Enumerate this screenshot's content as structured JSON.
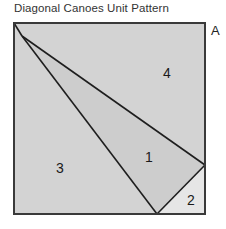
{
  "title": "Diagonal Canoes Unit Pattern",
  "unit_label": "A",
  "colors": {
    "background": "#d3d3d3",
    "piece_1": "#cdcdcd",
    "piece_2": "#e6e6e6",
    "lines": "#1e1e1e"
  },
  "pieces": [
    {
      "id": "1",
      "label": "1"
    },
    {
      "id": "2",
      "label": "2"
    },
    {
      "id": "3",
      "label": "3"
    },
    {
      "id": "4",
      "label": "4"
    }
  ]
}
